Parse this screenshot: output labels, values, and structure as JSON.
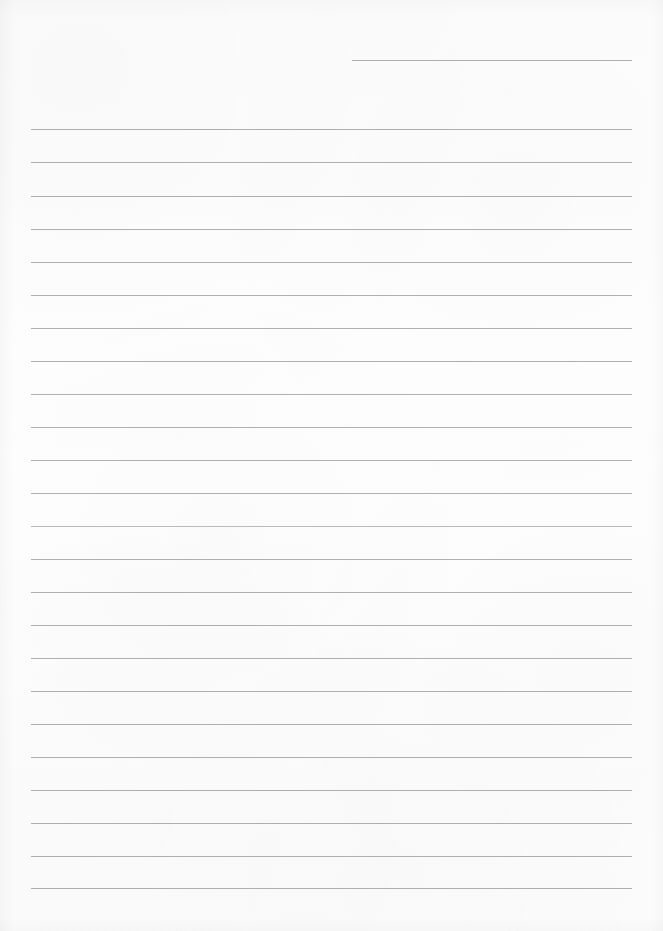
{
  "document": {
    "kind": "lined-paper-sheet",
    "title": "Blank ruled writing paper",
    "page_width": 663,
    "page_height": 931,
    "background_color": "#fdfdfd",
    "rule_color": "#a9acae",
    "rule_thickness": 1,
    "rule_spacing": 33,
    "text_content": "",
    "total_rules": 25
  },
  "rules": [
    {
      "name": "rule-line-1",
      "x": 352,
      "y": 60,
      "width": 280,
      "variant": "normal"
    },
    {
      "name": "rule-line-2",
      "x": 31,
      "y": 129,
      "width": 601,
      "variant": "normal"
    },
    {
      "name": "rule-line-3",
      "x": 31,
      "y": 162,
      "width": 601,
      "variant": "normal"
    },
    {
      "name": "rule-line-4",
      "x": 31,
      "y": 196,
      "width": 601,
      "variant": "normal"
    },
    {
      "name": "rule-line-5",
      "x": 31,
      "y": 229,
      "width": 601,
      "variant": "normal"
    },
    {
      "name": "rule-line-6",
      "x": 31,
      "y": 262,
      "width": 601,
      "variant": "normal"
    },
    {
      "name": "rule-line-7",
      "x": 31,
      "y": 295,
      "width": 601,
      "variant": "normal"
    },
    {
      "name": "rule-line-8",
      "x": 31,
      "y": 328,
      "width": 601,
      "variant": "normal"
    },
    {
      "name": "rule-line-9",
      "x": 31,
      "y": 361,
      "width": 601,
      "variant": "normal"
    },
    {
      "name": "rule-line-10",
      "x": 31,
      "y": 394,
      "width": 601,
      "variant": "normal"
    },
    {
      "name": "rule-line-11",
      "x": 31,
      "y": 427,
      "width": 601,
      "variant": "normal"
    },
    {
      "name": "rule-line-12",
      "x": 31,
      "y": 460,
      "width": 601,
      "variant": "normal"
    },
    {
      "name": "rule-line-13",
      "x": 31,
      "y": 493,
      "width": 601,
      "variant": "normal"
    },
    {
      "name": "rule-line-14",
      "x": 31,
      "y": 526,
      "width": 601,
      "variant": "soft"
    },
    {
      "name": "rule-line-15",
      "x": 31,
      "y": 559,
      "width": 601,
      "variant": "normal"
    },
    {
      "name": "rule-line-16",
      "x": 31,
      "y": 592,
      "width": 601,
      "variant": "normal"
    },
    {
      "name": "rule-line-17",
      "x": 31,
      "y": 625,
      "width": 601,
      "variant": "normal"
    },
    {
      "name": "rule-line-18",
      "x": 31,
      "y": 658,
      "width": 601,
      "variant": "normal"
    },
    {
      "name": "rule-line-19",
      "x": 31,
      "y": 691,
      "width": 601,
      "variant": "normal"
    },
    {
      "name": "rule-line-20",
      "x": 31,
      "y": 724,
      "width": 601,
      "variant": "normal"
    },
    {
      "name": "rule-line-21",
      "x": 31,
      "y": 757,
      "width": 601,
      "variant": "normal"
    },
    {
      "name": "rule-line-22",
      "x": 31,
      "y": 790,
      "width": 601,
      "variant": "normal"
    },
    {
      "name": "rule-line-23",
      "x": 31,
      "y": 823,
      "width": 601,
      "variant": "normal"
    },
    {
      "name": "rule-line-24",
      "x": 31,
      "y": 856,
      "width": 601,
      "variant": "normal"
    },
    {
      "name": "rule-line-25",
      "x": 31,
      "y": 888,
      "width": 601,
      "variant": "normal"
    }
  ]
}
